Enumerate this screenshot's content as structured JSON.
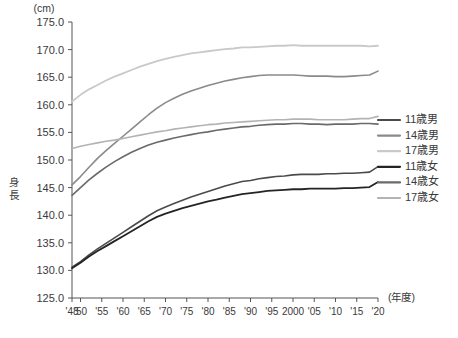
{
  "chart_data": {
    "type": "line",
    "title": "",
    "unit_label": "(cm)",
    "ylabel": "身長",
    "xlabel": "(年度)",
    "ylim": [
      125.0,
      175.0
    ],
    "ytick_step": 5.0,
    "ytick_labels": [
      "125.0",
      "130.0",
      "135.0",
      "140.0",
      "145.0",
      "150.0",
      "155.0",
      "160.0",
      "165.0",
      "170.0",
      "175.0"
    ],
    "ytick_values": [
      125.0,
      130.0,
      135.0,
      140.0,
      145.0,
      150.0,
      155.0,
      160.0,
      165.0,
      170.0,
      175.0
    ],
    "xlim": [
      1948,
      2020
    ],
    "xtick_values": [
      1948,
      1950,
      1955,
      1960,
      1965,
      1970,
      1975,
      1980,
      1985,
      1990,
      1995,
      2000,
      2005,
      2010,
      2015,
      2020
    ],
    "xtick_labels": [
      "'48",
      "'50",
      "'55",
      "'60",
      "'65",
      "'70",
      "'75",
      "'80",
      "'85",
      "'90",
      "'95",
      "2000",
      "'05",
      "'10",
      "'15",
      "'20"
    ],
    "grid": false,
    "legend_position": "right",
    "x": [
      1948,
      1950,
      1952,
      1954,
      1956,
      1958,
      1960,
      1962,
      1964,
      1966,
      1968,
      1970,
      1972,
      1974,
      1976,
      1978,
      1980,
      1982,
      1984,
      1986,
      1988,
      1990,
      1992,
      1994,
      1996,
      1998,
      2000,
      2002,
      2004,
      2006,
      2008,
      2010,
      2012,
      2014,
      2016,
      2018,
      2020
    ],
    "series": [
      {
        "name": "11歳男",
        "color": "#4a4a4a",
        "width": 1.6,
        "values": [
          130.6,
          131.6,
          132.8,
          133.9,
          134.9,
          135.9,
          136.9,
          137.9,
          138.9,
          139.9,
          140.8,
          141.5,
          142.1,
          142.7,
          143.3,
          143.8,
          144.3,
          144.8,
          145.3,
          145.7,
          146.1,
          146.3,
          146.6,
          146.8,
          147.0,
          147.1,
          147.3,
          147.4,
          147.4,
          147.4,
          147.5,
          147.5,
          147.6,
          147.6,
          147.7,
          147.8,
          148.8
        ]
      },
      {
        "name": "14歳男",
        "color": "#8a8a8a",
        "width": 1.6,
        "values": [
          145.5,
          147.0,
          148.7,
          150.3,
          151.7,
          153.0,
          154.3,
          155.6,
          156.9,
          158.2,
          159.4,
          160.4,
          161.2,
          161.9,
          162.5,
          163.0,
          163.5,
          163.9,
          164.3,
          164.6,
          164.9,
          165.1,
          165.3,
          165.4,
          165.4,
          165.4,
          165.4,
          165.3,
          165.2,
          165.2,
          165.2,
          165.1,
          165.1,
          165.2,
          165.3,
          165.4,
          166.1
        ]
      },
      {
        "name": "17歳男",
        "color": "#c9c9c9",
        "width": 1.8,
        "values": [
          160.6,
          161.8,
          162.8,
          163.6,
          164.4,
          165.1,
          165.7,
          166.3,
          166.9,
          167.4,
          167.9,
          168.3,
          168.7,
          169.0,
          169.3,
          169.5,
          169.7,
          169.9,
          170.1,
          170.2,
          170.4,
          170.4,
          170.5,
          170.6,
          170.7,
          170.7,
          170.8,
          170.7,
          170.7,
          170.7,
          170.7,
          170.7,
          170.7,
          170.7,
          170.7,
          170.6,
          170.7
        ]
      },
      {
        "name": "11歳女",
        "color": "#242424",
        "width": 1.8,
        "values": [
          130.4,
          131.4,
          132.5,
          133.5,
          134.4,
          135.3,
          136.2,
          137.1,
          138.0,
          138.9,
          139.7,
          140.3,
          140.8,
          141.3,
          141.7,
          142.1,
          142.5,
          142.8,
          143.2,
          143.5,
          143.8,
          144.0,
          144.2,
          144.4,
          144.5,
          144.6,
          144.7,
          144.7,
          144.8,
          144.8,
          144.8,
          144.8,
          144.9,
          144.9,
          145.0,
          145.1,
          146.0
        ]
      },
      {
        "name": "14歳女",
        "color": "#6a6a6a",
        "width": 1.6,
        "values": [
          143.6,
          145.0,
          146.4,
          147.6,
          148.7,
          149.7,
          150.6,
          151.4,
          152.1,
          152.7,
          153.2,
          153.6,
          154.0,
          154.3,
          154.6,
          154.9,
          155.1,
          155.4,
          155.6,
          155.8,
          156.0,
          156.1,
          156.3,
          156.4,
          156.5,
          156.5,
          156.6,
          156.6,
          156.5,
          156.5,
          156.4,
          156.5,
          156.5,
          156.5,
          156.6,
          156.6,
          156.5
        ]
      },
      {
        "name": "17歳女",
        "color": "#b3b3b3",
        "width": 1.6,
        "values": [
          152.1,
          152.5,
          152.8,
          153.1,
          153.4,
          153.6,
          153.9,
          154.2,
          154.5,
          154.8,
          155.1,
          155.3,
          155.6,
          155.8,
          156.0,
          156.2,
          156.4,
          156.5,
          156.7,
          156.8,
          156.9,
          157.0,
          157.1,
          157.2,
          157.3,
          157.3,
          157.4,
          157.4,
          157.4,
          157.3,
          157.3,
          157.3,
          157.3,
          157.4,
          157.5,
          157.5,
          157.9
        ]
      }
    ],
    "legend": [
      {
        "label": "11歳男",
        "color": "#4a4a4a"
      },
      {
        "label": "14歳男",
        "color": "#8a8a8a"
      },
      {
        "label": "17歳男",
        "color": "#c9c9c9"
      },
      {
        "label": "11歳女",
        "color": "#242424"
      },
      {
        "label": "14歳女",
        "color": "#6a6a6a"
      },
      {
        "label": "17歳女",
        "color": "#b3b3b3"
      }
    ]
  }
}
